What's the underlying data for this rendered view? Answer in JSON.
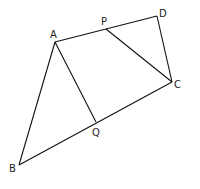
{
  "diagram": {
    "type": "geometry",
    "points": {
      "A": [
        55,
        42
      ],
      "P": [
        106,
        29
      ],
      "D": [
        157,
        16
      ],
      "C": [
        172,
        82
      ],
      "Q": [
        96,
        122
      ],
      "B": [
        19,
        165
      ]
    },
    "labels": {
      "A": "A",
      "P": "P",
      "D": "D",
      "C": "C",
      "Q": "Q",
      "B": "B"
    },
    "segments": [
      [
        "A",
        "D"
      ],
      [
        "D",
        "C"
      ],
      [
        "C",
        "B"
      ],
      [
        "B",
        "A"
      ],
      [
        "A",
        "Q"
      ],
      [
        "P",
        "C"
      ]
    ]
  }
}
